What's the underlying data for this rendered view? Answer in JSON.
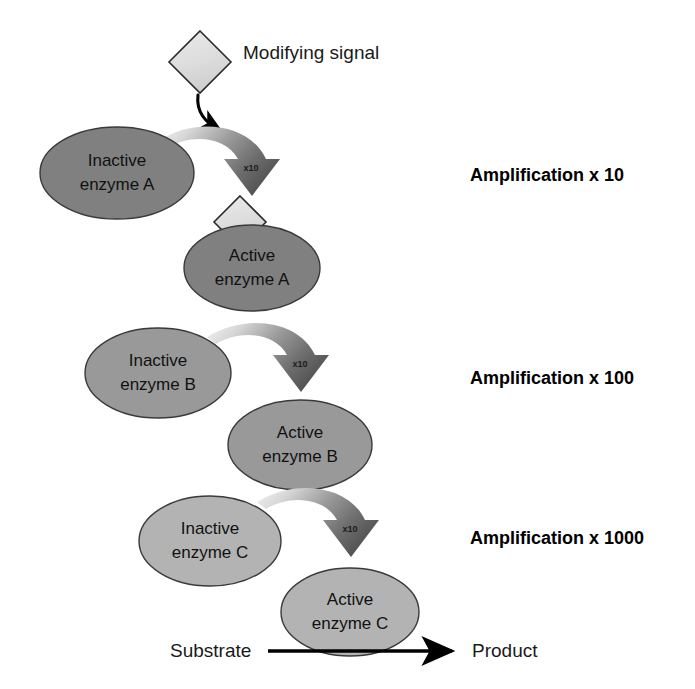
{
  "diagram": {
    "background_color": "#ffffff",
    "signal": {
      "label": "Modifying signal",
      "diamond_fill": "#dcdcdc",
      "diamond_outline": "#2b2b2b"
    },
    "arrow_step_label": "x10",
    "levels": [
      {
        "id": "a",
        "inactive_label_line1": "Inactive",
        "inactive_label_line2": "enzyme A",
        "active_label_line1": "Active",
        "active_label_line2": "enzyme A",
        "amplification_label": "Amplification x 10",
        "amplification_factor": 10,
        "ellipse_fill": "#808080",
        "has_signal_diamond": true
      },
      {
        "id": "b",
        "inactive_label_line1": "Inactive",
        "inactive_label_line2": "enzyme B",
        "active_label_line1": "Active",
        "active_label_line2": "enzyme B",
        "amplification_label": "Amplification x 100",
        "amplification_factor": 100,
        "ellipse_fill": "#999999",
        "has_signal_diamond": false
      },
      {
        "id": "c",
        "inactive_label_line1": "Inactive",
        "inactive_label_line2": "enzyme C",
        "active_label_line1": "Active",
        "active_label_line2": "enzyme C",
        "amplification_label": "Amplification x 1000",
        "amplification_factor": 1000,
        "ellipse_fill": "#b3b3b3",
        "has_signal_diamond": false
      }
    ],
    "reaction": {
      "substrate_label": "Substrate",
      "product_label": "Product"
    },
    "colors": {
      "arrow_gradient_light": "#efefef",
      "arrow_gradient_dark": "#5a5a5a",
      "text": "#111111",
      "outline": "#3a3a3a"
    }
  }
}
